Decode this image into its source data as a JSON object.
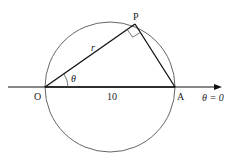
{
  "diagram": {
    "points": {
      "O": {
        "label": "O",
        "x": 45,
        "y": 87
      },
      "A": {
        "label": "A",
        "x": 175,
        "y": 87
      },
      "P": {
        "label": "P",
        "x": 135,
        "y": 24
      }
    },
    "circle": {
      "cx": 110,
      "cy": 87,
      "r": 65,
      "color": "#555555"
    },
    "labels": {
      "r": "r",
      "theta": "θ",
      "distance_OA": "10",
      "initial_line": "θ = 0"
    },
    "colors": {
      "line": "#111111",
      "circle": "#666666"
    }
  }
}
